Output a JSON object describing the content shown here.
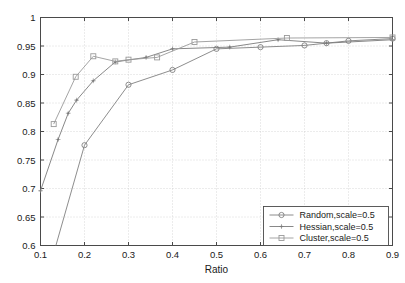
{
  "chart_data": {
    "type": "line",
    "title": "",
    "xlabel": "Ratio",
    "ylabel": "",
    "xlim": [
      0.1,
      0.9
    ],
    "ylim": [
      0.6,
      1.0
    ],
    "xticks": [
      "0.1",
      "0.2",
      "0.3",
      "0.4",
      "0.5",
      "0.6",
      "0.7",
      "0.8",
      "0.9"
    ],
    "xtick_values": [
      0.1,
      0.2,
      0.3,
      0.4,
      0.5,
      0.6,
      0.7,
      0.8,
      0.9
    ],
    "yticks": [
      "0.6",
      "0.65",
      "0.7",
      "0.75",
      "0.8",
      "0.85",
      "0.9",
      "0.95",
      "1"
    ],
    "ytick_values": [
      0.6,
      0.65,
      0.7,
      0.75,
      0.8,
      0.85,
      0.9,
      0.95,
      1.0
    ],
    "grid": true,
    "grid_style": "dotted",
    "legend_position": "lower right",
    "series": [
      {
        "name": "Random,scale=0.5",
        "marker": "circle",
        "color": "#808080",
        "points": [
          [
            0.135,
            0.6
          ],
          [
            0.2,
            0.776
          ],
          [
            0.3,
            0.882
          ],
          [
            0.4,
            0.908
          ],
          [
            0.5,
            0.945
          ],
          [
            0.6,
            0.948
          ],
          [
            0.7,
            0.951
          ],
          [
            0.75,
            0.955
          ],
          [
            0.8,
            0.959
          ],
          [
            0.9,
            0.963
          ]
        ]
      },
      {
        "name": "Hessian,scale=0.5",
        "marker": "star",
        "color": "#7a7a7a",
        "points": [
          [
            0.1,
            0.696
          ],
          [
            0.14,
            0.786
          ],
          [
            0.163,
            0.832
          ],
          [
            0.182,
            0.855
          ],
          [
            0.22,
            0.889
          ],
          [
            0.27,
            0.922
          ],
          [
            0.34,
            0.93
          ],
          [
            0.4,
            0.945
          ],
          [
            0.53,
            0.948
          ],
          [
            0.64,
            0.961
          ],
          [
            0.75,
            0.955
          ],
          [
            0.9,
            0.961
          ]
        ]
      },
      {
        "name": "Cluster,scale=0.5",
        "marker": "square",
        "color": "#9a9a9a",
        "points": [
          [
            0.13,
            0.813
          ],
          [
            0.18,
            0.896
          ],
          [
            0.22,
            0.932
          ],
          [
            0.27,
            0.923
          ],
          [
            0.3,
            0.926
          ],
          [
            0.365,
            0.93
          ],
          [
            0.45,
            0.957
          ],
          [
            0.66,
            0.964
          ],
          [
            0.9,
            0.965
          ]
        ]
      }
    ]
  },
  "legend": {
    "entries": [
      {
        "label": "Random,scale=0.5"
      },
      {
        "label": "Hessian,scale=0.5"
      },
      {
        "label": "Cluster,scale=0.5"
      }
    ]
  }
}
